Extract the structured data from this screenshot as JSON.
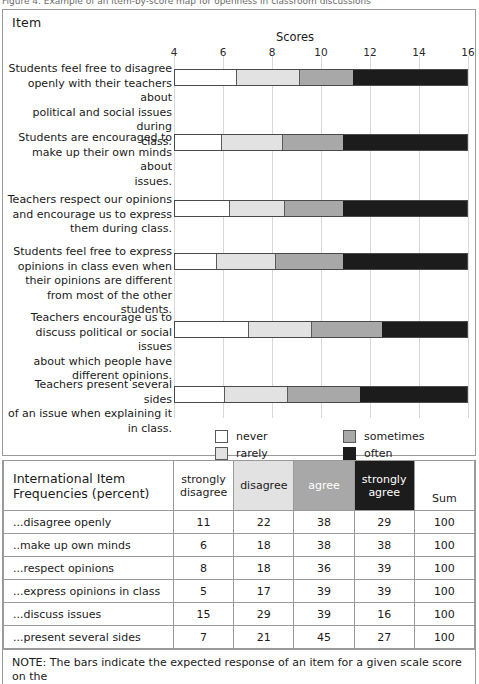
{
  "figure": {
    "clipped_caption": "Figure 4.  Example of an item-by-score map for openness in classroom discussions",
    "item_header": "Item",
    "scores_header": "Scores",
    "note": "NOTE: The bars indicate the expected response of an item for a given scale score on the"
  },
  "colors": {
    "never": "#ffffff",
    "rarely": "#e2e2e2",
    "sometimes": "#a8a8a8",
    "often": "#1c1c1c",
    "grid": "#d8d8d8",
    "border": "#9a9a9a"
  },
  "legend": {
    "entries": [
      {
        "key": "never",
        "label": "never"
      },
      {
        "key": "rarely",
        "label": "rarely"
      },
      {
        "key": "sometimes",
        "label": "sometimes"
      },
      {
        "key": "often",
        "label": "often"
      }
    ]
  },
  "chart_data": {
    "type": "bar",
    "orientation": "horizontal",
    "stacked": true,
    "title": "Scores",
    "xlabel": "Scores",
    "ylabel": "Item",
    "xlim": [
      4,
      16
    ],
    "xticks": [
      4,
      6,
      8,
      10,
      12,
      14,
      16
    ],
    "grid": true,
    "legend_position": "bottom-center",
    "categories": [
      "Students feel free to disagree openly with their teachers about political and social issues during class.",
      "Students are encouraged to make up their own minds about issues.",
      "Teachers respect our opinions and encourage us to express them during class.",
      "Students feel free to express opinions in class even when their opinions are different from most of the other students.",
      "Teachers encourage us to discuss political or social issues about which people have different opinions.",
      "Teachers present several sides of an issue when explaining it in class."
    ],
    "series": [
      {
        "name": "never",
        "boundaries": [
          6.5,
          5.9,
          6.2,
          5.7,
          7.0,
          6.0
        ]
      },
      {
        "name": "rarely",
        "boundaries": [
          9.1,
          8.4,
          8.5,
          8.1,
          9.6,
          8.6
        ]
      },
      {
        "name": "sometimes",
        "boundaries": [
          11.3,
          10.9,
          10.9,
          10.9,
          12.5,
          11.6
        ]
      },
      {
        "name": "often",
        "boundaries": [
          16,
          16,
          16,
          16,
          16,
          16
        ]
      }
    ],
    "bars": [
      {
        "label_lines": [
          "Students feel free to disagree",
          "openly with their teachers about",
          "political and social issues during",
          "class."
        ],
        "never_end": 6.5,
        "rarely_end": 9.1,
        "sometimes_end": 11.3,
        "often_end": 16
      },
      {
        "label_lines": [
          "Students are encouraged to",
          "make up their own minds about",
          "issues."
        ],
        "never_end": 5.9,
        "rarely_end": 8.4,
        "sometimes_end": 10.9,
        "often_end": 16
      },
      {
        "label_lines": [
          "Teachers respect our opinions",
          "and encourage us to express",
          "them during class."
        ],
        "never_end": 6.2,
        "rarely_end": 8.5,
        "sometimes_end": 10.9,
        "often_end": 16
      },
      {
        "label_lines": [
          "Students feel free to express",
          "opinions in class even when",
          "their opinions are different",
          "from most of the other students."
        ],
        "never_end": 5.7,
        "rarely_end": 8.1,
        "sometimes_end": 10.9,
        "often_end": 16
      },
      {
        "label_lines": [
          "Teachers encourage us to",
          "discuss political or social issues",
          "about which people have",
          "different opinions."
        ],
        "never_end": 7.0,
        "rarely_end": 9.6,
        "sometimes_end": 12.5,
        "often_end": 16
      },
      {
        "label_lines": [
          "Teachers present several sides",
          "of an issue when explaining it",
          "in class."
        ],
        "never_end": 6.0,
        "rarely_end": 8.6,
        "sometimes_end": 11.6,
        "often_end": 16
      }
    ]
  },
  "table": {
    "title_line1": "International Item",
    "title_line2": "Frequencies (percent)",
    "headers": [
      {
        "key": "strongly-disagree",
        "line1": "strongly",
        "line2": "disagree"
      },
      {
        "key": "disagree",
        "line1": "disagree",
        "line2": ""
      },
      {
        "key": "agree",
        "line1": "agree",
        "line2": ""
      },
      {
        "key": "strongly-agree",
        "line1": "strongly",
        "line2": "agree"
      },
      {
        "key": "sum",
        "line1": "Sum",
        "line2": ""
      }
    ],
    "rows": [
      {
        "label": "...disagree openly",
        "values": [
          11,
          22,
          38,
          29,
          100
        ]
      },
      {
        "label": "..make up own minds",
        "values": [
          6,
          18,
          38,
          38,
          100
        ]
      },
      {
        "label": "...respect opinions",
        "values": [
          8,
          18,
          36,
          39,
          100
        ]
      },
      {
        "label": "...express opinions in class",
        "values": [
          5,
          17,
          39,
          39,
          100
        ]
      },
      {
        "label": "...discuss issues",
        "values": [
          15,
          29,
          39,
          16,
          100
        ]
      },
      {
        "label": "...present several sides",
        "values": [
          7,
          21,
          45,
          27,
          100
        ]
      }
    ]
  }
}
